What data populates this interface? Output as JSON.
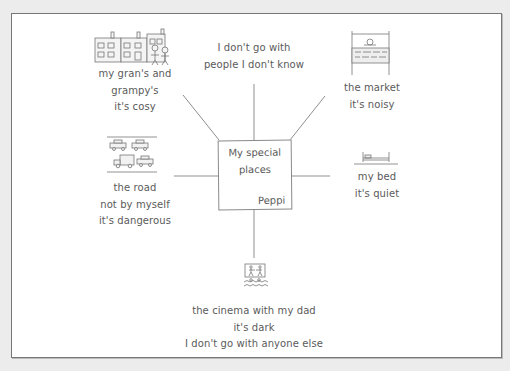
{
  "diagram": {
    "type": "mind-map",
    "center": {
      "title_lines": [
        "My special",
        "places"
      ],
      "author": "Peppi"
    },
    "branches": [
      {
        "id": "grans",
        "icon": "houses-and-people-icon",
        "lines": [
          "my gran's and",
          "grampy's",
          "it's cosy"
        ]
      },
      {
        "id": "strangers",
        "icon": null,
        "lines": [
          "I don't go with",
          "people I don't know"
        ]
      },
      {
        "id": "market",
        "icon": "market-stall-icon",
        "lines": [
          "the market",
          "it's noisy"
        ]
      },
      {
        "id": "road",
        "icon": "cars-on-road-icon",
        "lines": [
          "the road",
          "not by myself",
          "it's dangerous"
        ]
      },
      {
        "id": "bed",
        "icon": "bed-icon",
        "lines": [
          "my bed",
          "it's quiet"
        ]
      },
      {
        "id": "cinema",
        "icon": "cinema-screen-icon",
        "lines": [
          "the cinema with my dad",
          "it's dark",
          "I don't go with anyone else"
        ]
      }
    ]
  },
  "colors": {
    "background": "#ececec",
    "paper": "#ffffff",
    "ink": "#5a5a5a",
    "line": "#8a8a8a"
  }
}
